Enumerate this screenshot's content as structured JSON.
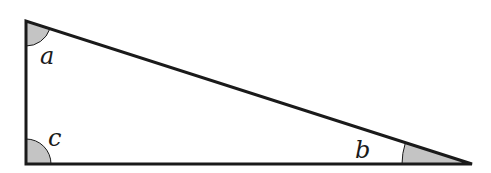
{
  "diagram": {
    "type": "right-triangle",
    "vertices": {
      "top": [
        26,
        21
      ],
      "bottom_left": [
        26,
        164
      ],
      "bottom_right": [
        472,
        164
      ]
    },
    "angles": [
      {
        "id": "a",
        "label": "a",
        "vertex": "top",
        "label_pos": [
          42,
          64
        ]
      },
      {
        "id": "b",
        "label": "b",
        "vertex": "bottom_right",
        "label_pos": [
          356,
          158
        ]
      },
      {
        "id": "c",
        "label": "c",
        "vertex": "bottom_left",
        "label_pos": [
          49,
          146
        ]
      }
    ],
    "colors": {
      "stroke": "#1a1a1a",
      "angle_fill": "#c4c4c4"
    }
  }
}
